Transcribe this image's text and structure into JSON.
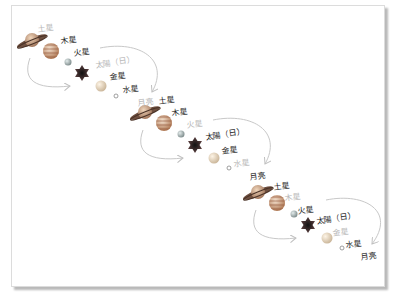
{
  "diagram": {
    "colors": {
      "dark_label": "#222222",
      "faded_label": "#b8b8b8",
      "arrow": "#c8c8c8"
    },
    "groups": [
      {
        "labels": [
          {
            "text": "土星",
            "style": "light"
          },
          {
            "text": "木星",
            "style": "dark"
          },
          {
            "text": "火星",
            "style": "dark"
          },
          {
            "text": "太陽（日）",
            "style": "light"
          },
          {
            "text": "金星",
            "style": "dark"
          },
          {
            "text": "水星",
            "style": "dark"
          },
          {
            "text": "月亮",
            "style": "light"
          }
        ]
      },
      {
        "labels": [
          {
            "text": "土星",
            "style": "dark"
          },
          {
            "text": "木星",
            "style": "dark"
          },
          {
            "text": "火星",
            "style": "light"
          },
          {
            "text": "太陽（日）",
            "style": "dark"
          },
          {
            "text": "金星",
            "style": "dark"
          },
          {
            "text": "水星",
            "style": "light"
          },
          {
            "text": "月亮",
            "style": "dark"
          }
        ]
      },
      {
        "labels": [
          {
            "text": "土星",
            "style": "dark"
          },
          {
            "text": "木星",
            "style": "light"
          },
          {
            "text": "火星",
            "style": "dark"
          },
          {
            "text": "太陽（日）",
            "style": "dark"
          },
          {
            "text": "金星",
            "style": "light"
          },
          {
            "text": "水星",
            "style": "dark"
          },
          {
            "text": "月亮",
            "style": "dark"
          }
        ]
      }
    ]
  }
}
